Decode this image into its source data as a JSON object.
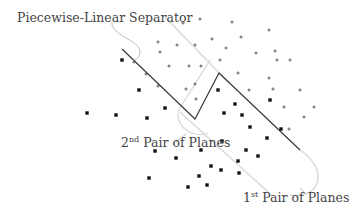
{
  "labels": {
    "separator": "Piecewise-Linear Separator",
    "pair2_base": "2",
    "pair2_sup": "nd",
    "pair2_rest": " Pair of Planes",
    "pair1_base": "1",
    "pair1_sup": "st",
    "pair1_rest": " Pair of Planes"
  },
  "colors": {
    "separator": "#333333",
    "planes": "#d0d0d0",
    "points": "#111111",
    "leader": "#b0b0b0"
  },
  "separator_path": [
    [
      122,
      49
    ],
    [
      195,
      119
    ],
    [
      219,
      73
    ],
    [
      300,
      150
    ]
  ],
  "plus_points": [
    [
      183,
      23
    ],
    [
      200,
      19
    ],
    [
      232,
      22
    ],
    [
      269,
      30
    ],
    [
      158,
      42
    ],
    [
      177,
      45
    ],
    [
      195,
      45
    ],
    [
      212,
      39
    ],
    [
      226,
      48
    ],
    [
      256,
      53
    ],
    [
      275,
      51
    ],
    [
      277,
      60
    ],
    [
      290,
      60
    ],
    [
      169,
      66
    ],
    [
      189,
      66
    ],
    [
      201,
      66
    ],
    [
      220,
      60
    ],
    [
      238,
      73
    ],
    [
      269,
      78
    ],
    [
      195,
      84
    ],
    [
      186,
      89
    ],
    [
      196,
      99
    ],
    [
      249,
      90
    ],
    [
      300,
      90
    ],
    [
      273,
      89
    ],
    [
      284,
      107
    ],
    [
      314,
      107
    ],
    [
      304,
      117
    ],
    [
      289,
      129
    ],
    [
      160,
      52
    ],
    [
      241,
      37
    ],
    [
      134,
      62
    ],
    [
      146,
      74
    ],
    [
      158,
      86
    ]
  ],
  "square_points": [
    [
      122,
      60
    ],
    [
      139,
      90
    ],
    [
      165,
      108
    ],
    [
      87,
      113
    ],
    [
      116,
      115
    ],
    [
      147,
      118
    ],
    [
      218,
      90
    ],
    [
      235,
      104
    ],
    [
      224,
      113
    ],
    [
      242,
      115
    ],
    [
      250,
      127
    ],
    [
      222,
      141
    ],
    [
      201,
      150
    ],
    [
      267,
      138
    ],
    [
      258,
      156
    ],
    [
      238,
      161
    ],
    [
      221,
      170
    ],
    [
      246,
      150
    ],
    [
      155,
      151
    ],
    [
      176,
      158
    ],
    [
      149,
      178
    ],
    [
      199,
      176
    ],
    [
      188,
      187
    ],
    [
      211,
      166
    ],
    [
      207,
      185
    ],
    [
      239,
      173
    ],
    [
      281,
      129
    ],
    [
      270,
      100
    ]
  ]
}
